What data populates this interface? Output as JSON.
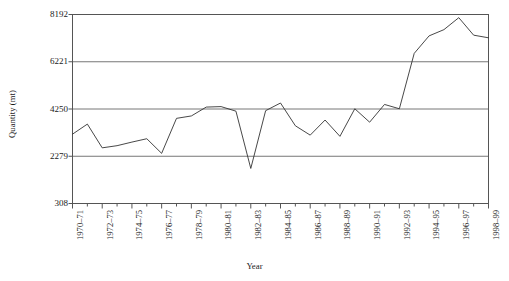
{
  "chart_data": {
    "type": "line",
    "title": "",
    "subtitle": "",
    "xlabel": "Year",
    "ylabel": "Quantity (mt)",
    "grid": true,
    "legend": false,
    "legend_position": "none",
    "line_color": "#333333",
    "background_color": "#ffffff",
    "axis_color": "#555555",
    "grid_color": "#666666",
    "ylim": [
      308,
      8192
    ],
    "yticks": [
      308,
      2279,
      4250,
      6221,
      8192
    ],
    "ytick_labels": [
      "308",
      "2279",
      "4250",
      "6221",
      "8192"
    ],
    "xtick_labels": [
      "1970–71",
      "1972–73",
      "1974–75",
      "1976–77",
      "1978–79",
      "1980–81",
      "1982–83",
      "1984–85",
      "1986–87",
      "1988–89",
      "1990–91",
      "1992–93",
      "1994–95",
      "1996–97",
      "1998–99"
    ],
    "x": [
      "1970-71",
      "1971-72",
      "1972-73",
      "1973-74",
      "1974-75",
      "1975-76",
      "1976-77",
      "1977-78",
      "1978-79",
      "1979-80",
      "1980-81",
      "1981-82",
      "1982-83",
      "1983-84",
      "1984-85",
      "1985-86",
      "1986-87",
      "1987-88",
      "1988-89",
      "1989-90",
      "1990-91",
      "1991-92",
      "1992-93",
      "1993-94",
      "1994-95",
      "1995-96",
      "1996-97",
      "1997-98",
      "1998-99"
    ],
    "categories": [
      "1970-71",
      "1971-72",
      "1972-73",
      "1973-74",
      "1974-75",
      "1975-76",
      "1976-77",
      "1977-78",
      "1978-79",
      "1979-80",
      "1980-81",
      "1981-82",
      "1982-83",
      "1983-84",
      "1984-85",
      "1985-86",
      "1986-87",
      "1987-88",
      "1988-89",
      "1989-90",
      "1990-91",
      "1991-92",
      "1992-93",
      "1993-94",
      "1994-95",
      "1995-96",
      "1996-97",
      "1997-98",
      "1998-99"
    ],
    "values": [
      3200,
      3620,
      2630,
      2720,
      2870,
      3010,
      2400,
      3860,
      3960,
      4330,
      4350,
      4160,
      1770,
      4180,
      4500,
      3550,
      3160,
      3790,
      3110,
      4260,
      3700,
      4440,
      4260,
      6570,
      7300,
      7560,
      8060,
      7330,
      7220
    ],
    "series": [
      {
        "name": "Quantity",
        "values": [
          3200,
          3620,
          2630,
          2720,
          2870,
          3010,
          2400,
          3860,
          3960,
          4330,
          4350,
          4160,
          1770,
          4180,
          4500,
          3550,
          3160,
          3790,
          3110,
          4260,
          3700,
          4440,
          4260,
          6570,
          7300,
          7560,
          8060,
          7330,
          7220
        ]
      }
    ]
  }
}
